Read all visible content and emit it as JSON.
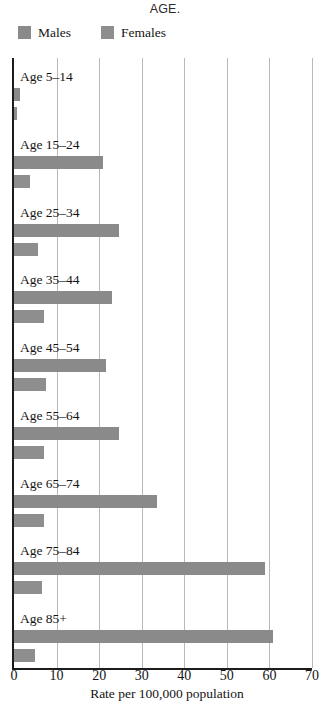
{
  "caption": "AGE.",
  "legend": {
    "position": "top-left",
    "items": [
      {
        "label": "Males",
        "color": "#8a8a8a",
        "icon": "legend-swatch-males"
      },
      {
        "label": "Females",
        "color": "#8e8e8e",
        "icon": "legend-swatch-females"
      }
    ]
  },
  "chart_data": {
    "type": "bar",
    "orientation": "horizontal",
    "title": "AGE.",
    "xlabel": "Rate per 100,000 population",
    "ylabel": "",
    "xlim": [
      0,
      70
    ],
    "xticks": [
      0,
      10,
      20,
      30,
      40,
      50,
      60,
      70
    ],
    "xtick_labels": [
      "0",
      "10",
      "20",
      "30",
      "40",
      "50",
      "60",
      "70"
    ],
    "grid": true,
    "grid_axis": "x",
    "legend_position": "top-left",
    "categories": [
      "Age 5–14",
      "Age 15–24",
      "Age 25–34",
      "Age 35–44",
      "Age 45–54",
      "Age 55–64",
      "Age 65–74",
      "Age 75–84",
      "Age 85+"
    ],
    "series": [
      {
        "name": "Males",
        "color": "#8a8a8a",
        "values": [
          1.3,
          21.0,
          24.7,
          23.0,
          21.7,
          24.7,
          33.5,
          59.0,
          60.8
        ]
      },
      {
        "name": "Females",
        "color": "#8e8e8e",
        "values": [
          0.8,
          3.8,
          5.6,
          7.0,
          7.5,
          7.0,
          7.0,
          6.6,
          4.9
        ]
      }
    ]
  }
}
